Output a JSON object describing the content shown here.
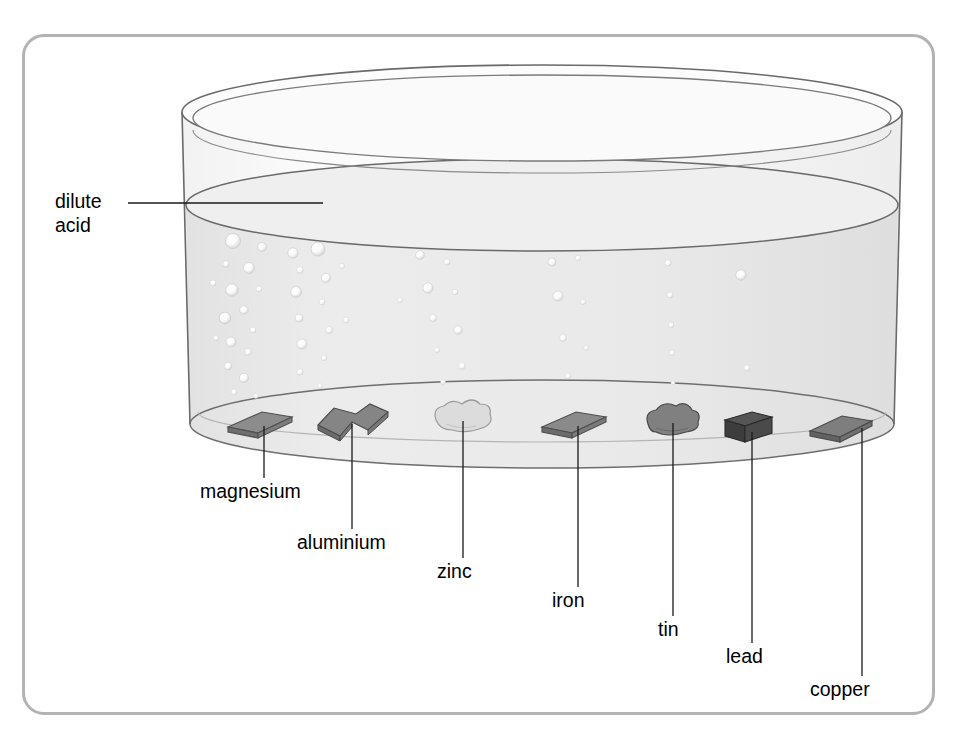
{
  "diagram": {
    "frame": {
      "border_color": "#b3b3b3",
      "background": "#ffffff"
    },
    "beaker": {
      "name": "beaker",
      "outline_color": "#666666",
      "glass_fill": "#fbfbfb",
      "liquid_fill": "#e8e8e8",
      "liquid_surface_fill": "#efefef"
    },
    "liquid": {
      "name": "dilute acid",
      "label": "dilute\nacid",
      "line1": "dilute",
      "line2": "acid"
    },
    "callouts": [
      {
        "id": "dilute-acid",
        "label_line1": "dilute",
        "label_line2": "acid",
        "label_x": 55,
        "label_y": 190,
        "leader": {
          "x1": 128,
          "y1": 203,
          "x2": 323,
          "y2": 203
        }
      }
    ],
    "metals": [
      {
        "id": "magnesium",
        "label": "magnesium",
        "shape": "flat-plate",
        "color": "#8c8c8c",
        "edge": "#4f4f4f",
        "cx": 256,
        "cy": 424,
        "w": 58,
        "h": 13,
        "bubbles": "very-high",
        "label_x": 200,
        "label_y": 480,
        "leader": {
          "x": 264,
          "y1": 426,
          "y2": 478
        }
      },
      {
        "id": "aluminium",
        "label": "aluminium",
        "shape": "bent-strip",
        "color": "#858585",
        "edge": "#4a4a4a",
        "cx": 352,
        "cy": 422,
        "w": 66,
        "h": 26,
        "bubbles": "high",
        "label_x": 297,
        "label_y": 531,
        "leader": {
          "x": 352,
          "y1": 424,
          "y2": 529
        }
      },
      {
        "id": "zinc",
        "label": "zinc",
        "shape": "lump",
        "color": "#dcdcdc",
        "edge": "#9a9a9a",
        "cx": 463,
        "cy": 417,
        "w": 56,
        "h": 26,
        "bubbles": "medium-high",
        "label_x": 437,
        "label_y": 560,
        "leader": {
          "x": 463,
          "y1": 421,
          "y2": 558
        }
      },
      {
        "id": "iron",
        "label": "iron",
        "shape": "flat-plate",
        "color": "#8a8a8a",
        "edge": "#4f4f4f",
        "cx": 570,
        "cy": 424,
        "w": 56,
        "h": 13,
        "bubbles": "medium",
        "label_x": 552,
        "label_y": 589,
        "leader": {
          "x": 578,
          "y1": 426,
          "y2": 587
        }
      },
      {
        "id": "tin",
        "label": "tin",
        "shape": "lump",
        "color": "#808080",
        "edge": "#4a4a4a",
        "cx": 673,
        "cy": 419,
        "w": 52,
        "h": 24,
        "bubbles": "low",
        "label_x": 658,
        "label_y": 618,
        "leader": {
          "x": 673,
          "y1": 423,
          "y2": 616
        }
      },
      {
        "id": "lead",
        "label": "lead",
        "shape": "cube",
        "color": "#4a4a4a",
        "edge": "#2b2b2b",
        "cx": 744,
        "cy": 426,
        "w": 38,
        "h": 26,
        "bubbles": "none",
        "label_x": 726,
        "label_y": 645,
        "leader": {
          "x": 752,
          "y1": 432,
          "y2": 643
        }
      },
      {
        "id": "copper",
        "label": "copper",
        "shape": "flat-plate",
        "color": "#7e7e7e",
        "edge": "#4a4a4a",
        "cx": 838,
        "cy": 428,
        "w": 58,
        "h": 13,
        "bubbles": "none",
        "label_x": 810,
        "label_y": 678,
        "leader": {
          "x": 862,
          "y1": 428,
          "y2": 676
        }
      }
    ],
    "leader_line_color": "#1a1a1a"
  }
}
